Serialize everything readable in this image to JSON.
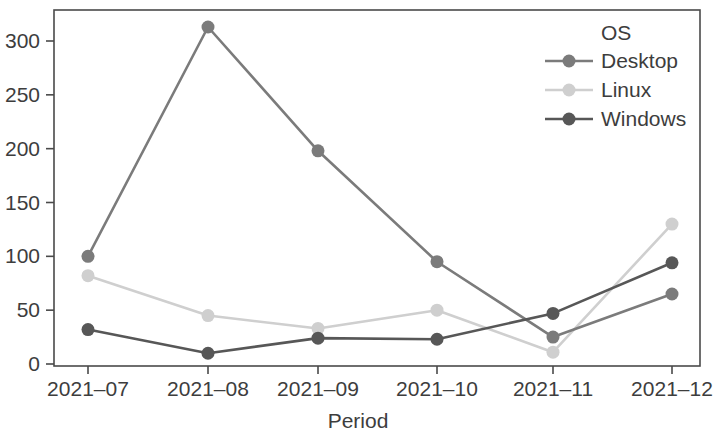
{
  "chart_data": {
    "type": "line",
    "title": "",
    "xlabel": "Period",
    "ylabel": "",
    "categories": [
      "2021–07",
      "2021–08",
      "2021–09",
      "2021–10",
      "2021–11",
      "2021–12"
    ],
    "x_tick_labels": [
      "2021–07",
      "2021–08",
      "2021–09",
      "2021–10",
      "2021–11",
      "2021–12"
    ],
    "y_tick_labels": [
      "0",
      "50",
      "100",
      "150",
      "200",
      "250",
      "300"
    ],
    "y_ticks": [
      0,
      50,
      100,
      150,
      200,
      250,
      300
    ],
    "ylim": [
      0,
      325
    ],
    "grid": false,
    "legend_position": "top-right",
    "legend_title": "OS",
    "series": [
      {
        "name": "Desktop",
        "color": "#7b7b7b",
        "values": [
          100,
          313,
          198,
          95,
          25,
          65
        ]
      },
      {
        "name": "Linux",
        "color": "#cfcfcf",
        "values": [
          82,
          45,
          33,
          50,
          11,
          130
        ]
      },
      {
        "name": "Windows",
        "color": "#575757",
        "values": [
          32,
          10,
          24,
          23,
          47,
          94
        ]
      }
    ]
  },
  "legend": {
    "title": "OS",
    "entries": [
      {
        "label": "Desktop",
        "color": "#7b7b7b"
      },
      {
        "label": "Linux",
        "color": "#cfcfcf"
      },
      {
        "label": "Windows",
        "color": "#575757"
      }
    ]
  },
  "axes": {
    "x_title": "Period",
    "y_title": ""
  },
  "colors": {
    "axis": "#4a4a4a",
    "text": "#3d3d3d",
    "background": "#ffffff"
  }
}
